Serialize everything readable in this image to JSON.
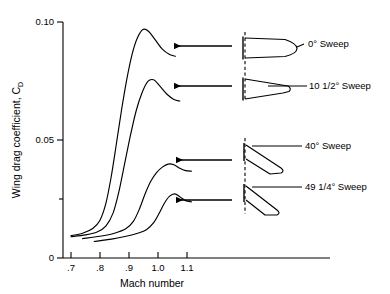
{
  "chart_data": {
    "type": "line",
    "title": "",
    "xlabel": "Mach number",
    "ylabel": "Wing drag coefficient, C_D",
    "ylabel_main": "Wing drag coefficient, C",
    "ylabel_sub": "D",
    "xlim": [
      0.66,
      1.16
    ],
    "ylim": [
      0,
      0.105
    ],
    "grid": false,
    "legend_position": "right-callouts",
    "xticks": [
      0.7,
      0.8,
      0.9,
      1.0,
      1.1
    ],
    "xtick_labels": [
      ".7",
      ".8",
      ".9",
      "1.0",
      "1.1"
    ],
    "yticks": [
      0,
      0.05,
      0.1
    ],
    "ytick_labels": [
      "0",
      "0.05",
      "0.10"
    ],
    "yminor_ticks": [
      0.025
    ],
    "series": [
      {
        "name": "0° Sweep",
        "peak_x": 0.95,
        "peak_y": 0.097,
        "points": [
          [
            0.7,
            0.0095
          ],
          [
            0.74,
            0.0105
          ],
          [
            0.775,
            0.0125
          ],
          [
            0.8,
            0.016
          ],
          [
            0.82,
            0.023
          ],
          [
            0.838,
            0.034
          ],
          [
            0.856,
            0.048
          ],
          [
            0.874,
            0.0625
          ],
          [
            0.892,
            0.0755
          ],
          [
            0.91,
            0.086
          ],
          [
            0.928,
            0.093
          ],
          [
            0.948,
            0.0968
          ],
          [
            0.968,
            0.096
          ],
          [
            0.99,
            0.0925
          ],
          [
            1.015,
            0.0885
          ],
          [
            1.04,
            0.0862
          ],
          [
            1.06,
            0.0855
          ]
        ]
      },
      {
        "name": "10 1/2° Sweep",
        "peak_x": 0.975,
        "peak_y": 0.0755,
        "points": [
          [
            0.7,
            0.009
          ],
          [
            0.75,
            0.0098
          ],
          [
            0.79,
            0.011
          ],
          [
            0.82,
            0.0135
          ],
          [
            0.845,
            0.019
          ],
          [
            0.865,
            0.028
          ],
          [
            0.885,
            0.04
          ],
          [
            0.905,
            0.052
          ],
          [
            0.925,
            0.0625
          ],
          [
            0.945,
            0.07
          ],
          [
            0.965,
            0.0748
          ],
          [
            0.985,
            0.0755
          ],
          [
            1.005,
            0.073
          ],
          [
            1.03,
            0.0695
          ],
          [
            1.055,
            0.0672
          ],
          [
            1.075,
            0.0665
          ]
        ]
      },
      {
        "name": "40° Sweep",
        "peak_x": 1.045,
        "peak_y": 0.04,
        "points": [
          [
            0.74,
            0.0082
          ],
          [
            0.8,
            0.0092
          ],
          [
            0.85,
            0.0105
          ],
          [
            0.89,
            0.0125
          ],
          [
            0.915,
            0.0155
          ],
          [
            0.935,
            0.0205
          ],
          [
            0.955,
            0.027
          ],
          [
            0.975,
            0.0325
          ],
          [
            0.995,
            0.0362
          ],
          [
            1.015,
            0.0385
          ],
          [
            1.035,
            0.0398
          ],
          [
            1.055,
            0.0395
          ],
          [
            1.075,
            0.038
          ],
          [
            1.095,
            0.037
          ],
          [
            1.115,
            0.0368
          ]
        ]
      },
      {
        "name": "49 1/4° Sweep",
        "peak_x": 1.055,
        "peak_y": 0.0272,
        "points": [
          [
            0.78,
            0.007
          ],
          [
            0.84,
            0.008
          ],
          [
            0.89,
            0.0092
          ],
          [
            0.93,
            0.0105
          ],
          [
            0.96,
            0.012
          ],
          [
            0.985,
            0.015
          ],
          [
            1.005,
            0.0192
          ],
          [
            1.022,
            0.0232
          ],
          [
            1.04,
            0.0262
          ],
          [
            1.058,
            0.0272
          ],
          [
            1.075,
            0.026
          ],
          [
            1.095,
            0.0243
          ],
          [
            1.115,
            0.0238
          ]
        ]
      }
    ]
  },
  "callouts": [
    {
      "label": "0° Sweep",
      "sweep_deg": 0
    },
    {
      "label": "10 1/2° Sweep",
      "sweep_deg": 10.5
    },
    {
      "label": "40° Sweep",
      "sweep_deg": 40
    },
    {
      "label": "49 1/4° Sweep",
      "sweep_deg": 49.25
    }
  ],
  "icons": {
    "arrow": "left-arrow-icon",
    "planform": "wing-planform-icon",
    "centerline": "fuselage-centerline-icon"
  }
}
